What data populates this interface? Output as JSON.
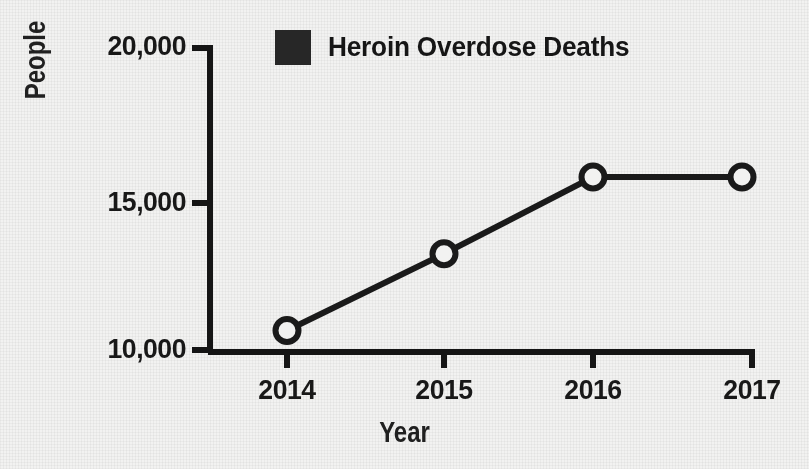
{
  "chart_data": {
    "type": "line",
    "title": "",
    "subtitle": "",
    "xlabel": "Year",
    "ylabel": "People",
    "categories": [
      "2014",
      "2015",
      "2016",
      "2017"
    ],
    "x": [
      2014,
      2015,
      2016,
      2017
    ],
    "series": [
      {
        "name": "Heroin Overdose Deaths",
        "values": [
          10700,
          13200,
          15700,
          15700
        ],
        "color": "#1a1a1a",
        "marker": "open-circle"
      }
    ],
    "values": [
      10700,
      13200,
      15700,
      15700
    ],
    "ylim": [
      10000,
      20000
    ],
    "yticks": [
      10000,
      15000,
      20000
    ],
    "ytick_labels": [
      "10,000",
      "15,000",
      "20,000"
    ],
    "xtick_labels": [
      "2014",
      "2015",
      "2016",
      "2017"
    ],
    "grid": false,
    "legend_position": "top-center",
    "legend": [
      {
        "label": "Heroin Overdose Deaths",
        "color": "#272727",
        "swatch": "filled-square"
      }
    ],
    "annotations": []
  },
  "axes": {
    "y_title": "People",
    "x_title": "Year",
    "y_tick_labels": [
      "20,000",
      "15,000",
      "10,000"
    ],
    "x_tick_labels": [
      "2014",
      "2015",
      "2016",
      "2017"
    ],
    "axis_color": "#151515"
  },
  "legend": {
    "label": "Heroin Overdose Deaths",
    "swatch_color": "#272727",
    "swatch_icon": "filled-square-icon"
  },
  "colors": {
    "background": "#f2f2f1",
    "line": "#1a1a1a",
    "marker_stroke": "#1a1a1a",
    "marker_fill": "#f2f2f1",
    "text": "#181818"
  }
}
